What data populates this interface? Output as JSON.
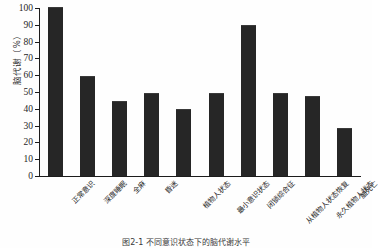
{
  "chart_data": {
    "type": "bar",
    "title": "",
    "xlabel": "",
    "ylabel": "脑代谢（%）",
    "ylim": [
      0,
      100
    ],
    "yticks": [
      0,
      10,
      20,
      30,
      40,
      50,
      60,
      70,
      80,
      90,
      100
    ],
    "grid": false,
    "legend": null,
    "categories": [
      "正常意识",
      "深度睡眠",
      "全麻",
      "昏迷",
      "植物人状态",
      "最小意识状态",
      "闭锁综合征",
      "从植物人状态恢复",
      "永久植物人状态",
      "脑死亡"
    ],
    "values": [
      100,
      59,
      44,
      49,
      39,
      49,
      89,
      49,
      47,
      28
    ],
    "bar_color": "#262626"
  },
  "caption": {
    "text": "图2-1 不同意识状态下的脑代谢水平"
  }
}
